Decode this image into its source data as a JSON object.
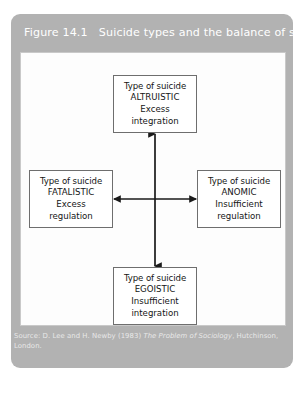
{
  "figure": {
    "title": "Figure 14.1   Suicide types and the balance of society",
    "panel_color": "#b2b2b2",
    "inner_panel_color": "#fdfdfd",
    "box_border_color": "#6e6e6e",
    "arrow_color": "#1a1a1a",
    "title_color": "#ffffff"
  },
  "diagram": {
    "type": "2x2-axis-diagram",
    "boxes": {
      "altruistic": {
        "position": "top",
        "line1": "Type of suicide",
        "line2": "ALTRUISTIC",
        "line3": "Excess",
        "line4": "integration"
      },
      "fatalistic": {
        "position": "left",
        "line1": "Type of suicide",
        "line2": "FATALISTIC",
        "line3": "Excess",
        "line4": "regulation"
      },
      "anomic": {
        "position": "right",
        "line1": "Type of suicide",
        "line2": "ANOMIC",
        "line3": "Insufficient",
        "line4": "regulation"
      },
      "egoistic": {
        "position": "bottom",
        "line1": "Type of suicide",
        "line2": "EGOISTIC",
        "line3": "Insufficient",
        "line4": "integration"
      }
    },
    "connectors": [
      {
        "name": "vertical-axis",
        "from": "altruistic",
        "to": "egoistic",
        "style": "double-headed-arrow"
      },
      {
        "name": "horizontal-axis",
        "from": "fatalistic",
        "to": "anomic",
        "style": "double-headed-arrow"
      }
    ]
  },
  "source": {
    "prefix": "Source: D. Lee and H. Newby (1983) ",
    "title_italic": "The Problem of Sociology",
    "suffix": ", Hutchinson,",
    "line2": "London."
  }
}
